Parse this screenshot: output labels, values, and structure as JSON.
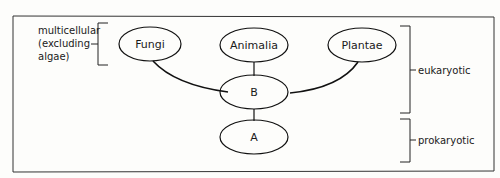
{
  "diagram": {
    "title_fragment": "...diagram...",
    "nodes": [
      {
        "id": "fungi",
        "label": "Fungi"
      },
      {
        "id": "animalia",
        "label": "Animalia"
      },
      {
        "id": "plantae",
        "label": "Plantae"
      },
      {
        "id": "b",
        "label": "B"
      },
      {
        "id": "a",
        "label": "A"
      }
    ],
    "edges": [
      {
        "from": "fungi",
        "to": "b"
      },
      {
        "from": "animalia",
        "to": "b"
      },
      {
        "from": "plantae",
        "to": "b"
      },
      {
        "from": "b",
        "to": "a"
      }
    ],
    "annotations": {
      "multicellular_line1": "multicellular",
      "multicellular_line2": "(excluding",
      "multicellular_line3": "algae)",
      "eukaryotic": "eukaryotic",
      "prokaryotic": "prokaryotic"
    }
  }
}
